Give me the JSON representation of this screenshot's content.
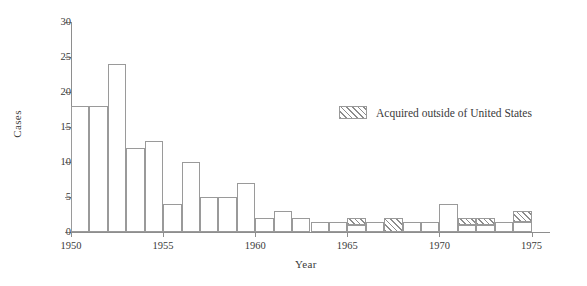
{
  "chart_data": {
    "type": "bar",
    "title": "",
    "xlabel": "Year",
    "ylabel": "Cases",
    "xlim": [
      1950,
      1976
    ],
    "ylim": [
      0,
      30
    ],
    "ytick_labels": [
      "0",
      "5",
      "10",
      "15",
      "20",
      "25",
      "30"
    ],
    "ytick_values": [
      0,
      5,
      10,
      15,
      20,
      25,
      30
    ],
    "xtick_labels": [
      "1950",
      "1955",
      "1960",
      "1965",
      "1970",
      "1975"
    ],
    "xtick_values": [
      1950,
      1955,
      1960,
      1965,
      1970,
      1975
    ],
    "grid": false,
    "legend_position": "upper right",
    "series": [
      {
        "name": "Total cases",
        "categories": [
          1950,
          1951,
          1952,
          1953,
          1954,
          1955,
          1956,
          1957,
          1958,
          1959,
          1960,
          1961,
          1962,
          1963,
          1964,
          1965,
          1966,
          1967,
          1968,
          1969,
          1970,
          1971,
          1972,
          1973,
          1974
        ],
        "values": [
          18,
          18,
          24,
          12,
          13,
          4,
          10,
          5,
          5,
          7,
          2,
          3,
          2,
          1.5,
          1.5,
          2,
          1.5,
          2,
          1.5,
          1.5,
          4,
          2,
          2,
          1.5,
          3
        ]
      },
      {
        "name": "Acquired outside of United States",
        "categories": [
          1950,
          1951,
          1952,
          1953,
          1954,
          1955,
          1956,
          1957,
          1958,
          1959,
          1960,
          1961,
          1962,
          1963,
          1964,
          1965,
          1966,
          1967,
          1968,
          1969,
          1970,
          1971,
          1972,
          1973,
          1974
        ],
        "values": [
          0,
          0,
          0,
          0,
          0,
          0,
          0,
          0,
          0,
          0,
          0,
          0,
          0,
          0,
          0,
          1,
          0,
          2,
          0,
          0,
          0,
          1,
          1,
          0,
          1.5
        ]
      }
    ],
    "legend": [
      {
        "label": "Acquired outside of United States",
        "pattern": "diagonal-hatch"
      }
    ]
  },
  "legend": {
    "label": "Acquired outside of United States"
  },
  "axes": {
    "y_title": "Cases",
    "x_title": "Year"
  },
  "colors": {
    "stroke": "#9a9a9a",
    "axis": "#8e8e8e",
    "text": "#3a3a3a",
    "background": "#ffffff",
    "hatch": "#787878"
  }
}
